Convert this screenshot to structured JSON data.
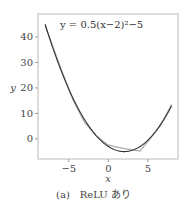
{
  "chart_data": {
    "type": "line",
    "title": "",
    "annotation": "y = 0.5(x−2)²−5",
    "xlabel": "x",
    "ylabel": "y",
    "xlim": [
      -8.9,
      8.8
    ],
    "ylim": [
      -7.9,
      49
    ],
    "xticks": [
      -5,
      0,
      5
    ],
    "xtick_labels": [
      "−5",
      "0",
      "5"
    ],
    "yticks": [
      0,
      10,
      20,
      30,
      40
    ],
    "ytick_labels": [
      "0",
      "10",
      "20",
      "30",
      "40"
    ],
    "grid": false,
    "legend": null,
    "series": [
      {
        "name": "target y = 0.5(x−2)²−5",
        "color": "#333333",
        "x": [
          -8,
          -7,
          -6,
          -5,
          -4,
          -3,
          -2,
          -1,
          0,
          1,
          2,
          3,
          4,
          5,
          6,
          7,
          8
        ],
        "y": [
          45,
          35.5,
          27,
          19.5,
          13,
          7.5,
          3,
          -0.5,
          -3,
          -4.5,
          -5,
          -4.5,
          -3,
          -0.5,
          3,
          7.5,
          13
        ]
      },
      {
        "name": "ReLU network approximation",
        "color": "#aaaaaa",
        "x": [
          -8,
          -6,
          -4.5,
          -3,
          -1.5,
          0,
          2,
          4,
          5,
          6.5,
          8
        ],
        "y": [
          44.5,
          27.5,
          15.5,
          6.5,
          1,
          -2.5,
          -3.8,
          -4.8,
          -1,
          5,
          13.5
        ]
      }
    ],
    "caption": "(a)　ReLU あり"
  }
}
